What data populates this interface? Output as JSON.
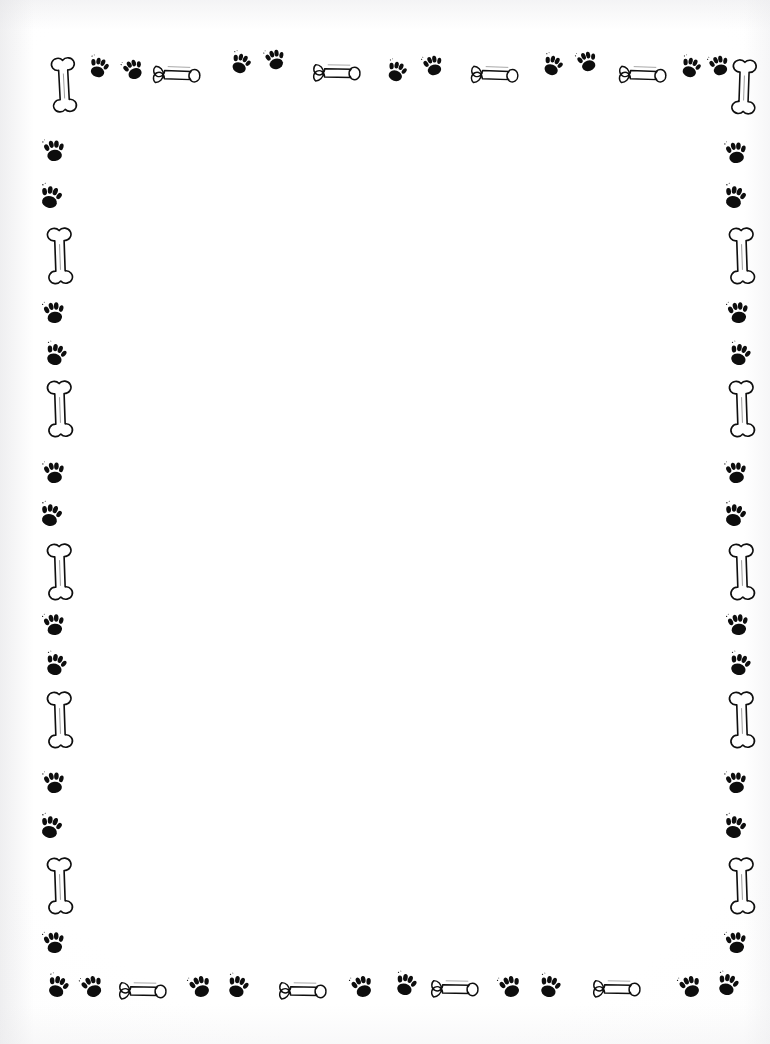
{
  "document": {
    "kind": "stationery-page",
    "title": "Dog Bones and Paw Prints Stationery",
    "theme": "dog",
    "page_width": 770,
    "page_height": 1044,
    "background_color": "#ffffff",
    "ink_color": "#0d0d0d",
    "writing_area_text": "",
    "writing_area_note": "blank"
  },
  "border": {
    "description": "Decorative frame of dog bones and paw prints on all four sides",
    "motif_names": [
      "bone-vertical",
      "bone-horizontal",
      "paw-print"
    ],
    "corner_motif": "bone-vertical",
    "repeat_pattern": [
      "paw-print",
      "paw-print",
      "bone"
    ],
    "top": [
      {
        "motif": "bone-vertical",
        "x": 44,
        "y": 52,
        "w": 40,
        "h": 68,
        "rot": -3
      },
      {
        "motif": "paw-print",
        "x": 86,
        "y": 54,
        "w": 26,
        "h": 25,
        "rot": 16
      },
      {
        "motif": "paw-print",
        "x": 120,
        "y": 56,
        "w": 26,
        "h": 25,
        "rot": -22
      },
      {
        "motif": "bone-horizontal",
        "x": 146,
        "y": 50,
        "w": 66,
        "h": 34,
        "rot": 2
      },
      {
        "motif": "paw-print",
        "x": 228,
        "y": 50,
        "w": 26,
        "h": 25,
        "rot": 20
      },
      {
        "motif": "paw-print",
        "x": 262,
        "y": 46,
        "w": 26,
        "h": 25,
        "rot": -14
      },
      {
        "motif": "bone-horizontal",
        "x": 306,
        "y": 48,
        "w": 66,
        "h": 34,
        "rot": 1
      },
      {
        "motif": "paw-print",
        "x": 384,
        "y": 58,
        "w": 26,
        "h": 25,
        "rot": 18
      },
      {
        "motif": "paw-print",
        "x": 420,
        "y": 52,
        "w": 26,
        "h": 25,
        "rot": -16
      },
      {
        "motif": "bone-horizontal",
        "x": 464,
        "y": 50,
        "w": 66,
        "h": 34,
        "rot": 2
      },
      {
        "motif": "paw-print",
        "x": 540,
        "y": 52,
        "w": 26,
        "h": 25,
        "rot": 20
      },
      {
        "motif": "paw-print",
        "x": 574,
        "y": 48,
        "w": 26,
        "h": 25,
        "rot": -18
      },
      {
        "motif": "bone-horizontal",
        "x": 612,
        "y": 50,
        "w": 66,
        "h": 34,
        "rot": 2
      },
      {
        "motif": "paw-print",
        "x": 678,
        "y": 54,
        "w": 26,
        "h": 25,
        "rot": 18
      },
      {
        "motif": "paw-print",
        "x": 706,
        "y": 52,
        "w": 26,
        "h": 25,
        "rot": -16
      },
      {
        "motif": "bone-vertical",
        "x": 724,
        "y": 54,
        "w": 40,
        "h": 68,
        "rot": 2
      }
    ],
    "left": [
      {
        "motif": "paw-print",
        "x": 40,
        "y": 136,
        "w": 28,
        "h": 27,
        "rot": -6
      },
      {
        "motif": "paw-print",
        "x": 36,
        "y": 182,
        "w": 30,
        "h": 28,
        "rot": 14
      },
      {
        "motif": "bone-vertical",
        "x": 40,
        "y": 222,
        "w": 40,
        "h": 70,
        "rot": -2
      },
      {
        "motif": "paw-print",
        "x": 40,
        "y": 298,
        "w": 28,
        "h": 27,
        "rot": -8
      },
      {
        "motif": "paw-print",
        "x": 42,
        "y": 340,
        "w": 28,
        "h": 27,
        "rot": 16
      },
      {
        "motif": "bone-vertical",
        "x": 40,
        "y": 375,
        "w": 40,
        "h": 70,
        "rot": -2
      },
      {
        "motif": "paw-print",
        "x": 40,
        "y": 458,
        "w": 28,
        "h": 27,
        "rot": -6
      },
      {
        "motif": "paw-print",
        "x": 36,
        "y": 500,
        "w": 30,
        "h": 28,
        "rot": 14
      },
      {
        "motif": "bone-vertical",
        "x": 40,
        "y": 538,
        "w": 40,
        "h": 70,
        "rot": -2
      },
      {
        "motif": "paw-print",
        "x": 40,
        "y": 610,
        "w": 28,
        "h": 27,
        "rot": -8
      },
      {
        "motif": "paw-print",
        "x": 42,
        "y": 650,
        "w": 28,
        "h": 27,
        "rot": 16
      },
      {
        "motif": "bone-vertical",
        "x": 40,
        "y": 686,
        "w": 40,
        "h": 70,
        "rot": -2
      },
      {
        "motif": "paw-print",
        "x": 40,
        "y": 768,
        "w": 28,
        "h": 27,
        "rot": -6
      },
      {
        "motif": "paw-print",
        "x": 36,
        "y": 812,
        "w": 30,
        "h": 28,
        "rot": 14
      },
      {
        "motif": "bone-vertical",
        "x": 40,
        "y": 852,
        "w": 40,
        "h": 70,
        "rot": -2
      },
      {
        "motif": "paw-print",
        "x": 40,
        "y": 928,
        "w": 28,
        "h": 27,
        "rot": -8
      }
    ],
    "right": [
      {
        "motif": "paw-print",
        "x": 722,
        "y": 138,
        "w": 28,
        "h": 27,
        "rot": -6
      },
      {
        "motif": "paw-print",
        "x": 720,
        "y": 182,
        "w": 30,
        "h": 28,
        "rot": 14
      },
      {
        "motif": "bone-vertical",
        "x": 722,
        "y": 222,
        "w": 40,
        "h": 70,
        "rot": -2
      },
      {
        "motif": "paw-print",
        "x": 724,
        "y": 298,
        "w": 28,
        "h": 27,
        "rot": -8
      },
      {
        "motif": "paw-print",
        "x": 726,
        "y": 340,
        "w": 28,
        "h": 27,
        "rot": 16
      },
      {
        "motif": "bone-vertical",
        "x": 722,
        "y": 375,
        "w": 40,
        "h": 70,
        "rot": -2
      },
      {
        "motif": "paw-print",
        "x": 722,
        "y": 458,
        "w": 28,
        "h": 27,
        "rot": -6
      },
      {
        "motif": "paw-print",
        "x": 720,
        "y": 500,
        "w": 30,
        "h": 28,
        "rot": 14
      },
      {
        "motif": "bone-vertical",
        "x": 722,
        "y": 538,
        "w": 40,
        "h": 70,
        "rot": -2
      },
      {
        "motif": "paw-print",
        "x": 724,
        "y": 610,
        "w": 28,
        "h": 27,
        "rot": -8
      },
      {
        "motif": "paw-print",
        "x": 726,
        "y": 650,
        "w": 28,
        "h": 27,
        "rot": 16
      },
      {
        "motif": "bone-vertical",
        "x": 722,
        "y": 686,
        "w": 40,
        "h": 70,
        "rot": -2
      },
      {
        "motif": "paw-print",
        "x": 722,
        "y": 768,
        "w": 28,
        "h": 27,
        "rot": -6
      },
      {
        "motif": "paw-print",
        "x": 720,
        "y": 812,
        "w": 30,
        "h": 28,
        "rot": 14
      },
      {
        "motif": "bone-vertical",
        "x": 722,
        "y": 852,
        "w": 40,
        "h": 70,
        "rot": -2
      },
      {
        "motif": "paw-print",
        "x": 722,
        "y": 928,
        "w": 28,
        "h": 27,
        "rot": -8
      }
    ],
    "bottom": [
      {
        "motif": "paw-print",
        "x": 44,
        "y": 972,
        "w": 28,
        "h": 27,
        "rot": 18
      },
      {
        "motif": "paw-print",
        "x": 78,
        "y": 972,
        "w": 28,
        "h": 27,
        "rot": -20
      },
      {
        "motif": "bone-horizontal",
        "x": 112,
        "y": 966,
        "w": 66,
        "h": 34,
        "rot": 1
      },
      {
        "motif": "paw-print",
        "x": 186,
        "y": 972,
        "w": 28,
        "h": 27,
        "rot": -18
      },
      {
        "motif": "paw-print",
        "x": 224,
        "y": 972,
        "w": 28,
        "h": 27,
        "rot": 16
      },
      {
        "motif": "bone-horizontal",
        "x": 272,
        "y": 966,
        "w": 66,
        "h": 34,
        "rot": 1
      },
      {
        "motif": "paw-print",
        "x": 348,
        "y": 972,
        "w": 28,
        "h": 27,
        "rot": -18
      },
      {
        "motif": "paw-print",
        "x": 392,
        "y": 970,
        "w": 28,
        "h": 27,
        "rot": 16
      },
      {
        "motif": "bone-horizontal",
        "x": 424,
        "y": 964,
        "w": 66,
        "h": 34,
        "rot": 1
      },
      {
        "motif": "paw-print",
        "x": 496,
        "y": 972,
        "w": 28,
        "h": 27,
        "rot": -18
      },
      {
        "motif": "paw-print",
        "x": 536,
        "y": 972,
        "w": 28,
        "h": 27,
        "rot": 16
      },
      {
        "motif": "bone-horizontal",
        "x": 586,
        "y": 964,
        "w": 66,
        "h": 34,
        "rot": 1
      },
      {
        "motif": "paw-print",
        "x": 676,
        "y": 972,
        "w": 28,
        "h": 27,
        "rot": -18
      },
      {
        "motif": "paw-print",
        "x": 714,
        "y": 970,
        "w": 28,
        "h": 27,
        "rot": 16
      }
    ]
  }
}
